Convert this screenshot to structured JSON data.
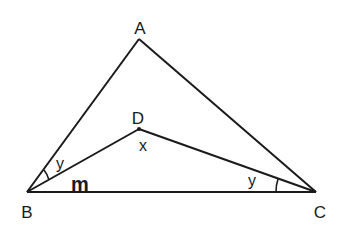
{
  "diagram": {
    "type": "geometry",
    "stroke_color": "#1a1a1a",
    "background": "#ffffff",
    "points": {
      "A": {
        "label": "A",
        "x": 139,
        "y": 39
      },
      "B": {
        "label": "B",
        "x": 27,
        "y": 192
      },
      "C": {
        "label": "C",
        "x": 316,
        "y": 192
      },
      "D": {
        "label": "D",
        "x": 139,
        "y": 129
      }
    },
    "segments": [
      "AB",
      "AC",
      "BC",
      "BD",
      "DC"
    ],
    "angle_labels": {
      "angle_D": "x",
      "angle_ABD": "y",
      "angle_DCB": "y"
    },
    "side_labels": {
      "BC": "m"
    }
  }
}
